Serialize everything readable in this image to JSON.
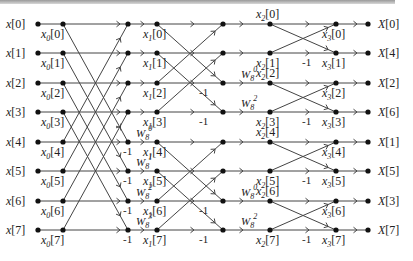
{
  "rows_y": [
    24,
    53,
    83,
    112,
    142,
    171,
    201,
    230
  ],
  "columns_x": {
    "input": 38,
    "s0": 63,
    "s1_in": 128,
    "s1": 157,
    "s2_in": 223,
    "s2": 270,
    "s3": 336,
    "output": 368
  },
  "inputs": [
    "x[0]",
    "x[1]",
    "x[2]",
    "x[3]",
    "x[4]",
    "x[5]",
    "x[6]",
    "x[7]"
  ],
  "outputs": [
    "X[0]",
    "X[4]",
    "X[2]",
    "X[6]",
    "X[1]",
    "X[5]",
    "X[3]",
    "X[7]"
  ],
  "stage0_labels": [
    {
      "base": "x",
      "sub": "0",
      "idx": "[0]"
    },
    {
      "base": "x",
      "sub": "0",
      "idx": "[1]"
    },
    {
      "base": "x",
      "sub": "0",
      "idx": "[2]"
    },
    {
      "base": "x",
      "sub": "0",
      "idx": "[3]"
    },
    {
      "base": "x",
      "sub": "0",
      "idx": "[4]"
    },
    {
      "base": "x",
      "sub": "0",
      "idx": "[5]"
    },
    {
      "base": "x",
      "sub": "0",
      "idx": "[6]"
    },
    {
      "base": "x",
      "sub": "0",
      "idx": "[7]"
    }
  ],
  "stage1_labels": [
    {
      "base": "x",
      "sub": "1",
      "idx": "[0]"
    },
    {
      "base": "x",
      "sub": "1",
      "idx": "[1]"
    },
    {
      "base": "x",
      "sub": "1",
      "idx": "[2]"
    },
    {
      "base": "x",
      "sub": "1",
      "idx": "[3]"
    },
    {
      "base": "x",
      "sub": "1",
      "idx": "[4]"
    },
    {
      "base": "x",
      "sub": "1",
      "idx": "[5]"
    },
    {
      "base": "x",
      "sub": "1",
      "idx": "[6]"
    },
    {
      "base": "x",
      "sub": "1",
      "idx": "[7]"
    }
  ],
  "stage2_labels": [
    {
      "base": "x",
      "sub": "2",
      "idx": "[0]"
    },
    {
      "base": "x",
      "sub": "2",
      "idx": "[1]"
    },
    {
      "base": "x",
      "sub": "2",
      "idx": "[2]"
    },
    {
      "base": "x",
      "sub": "2",
      "idx": "[3]"
    },
    {
      "base": "x",
      "sub": "2",
      "idx": "[4]"
    },
    {
      "base": "x",
      "sub": "2",
      "idx": "[5]"
    },
    {
      "base": "x",
      "sub": "2",
      "idx": "[6]"
    },
    {
      "base": "x",
      "sub": "2",
      "idx": "[7]"
    }
  ],
  "stage3_labels": [
    {
      "base": "x",
      "sub": "3",
      "idx": "[0]"
    },
    {
      "base": "x",
      "sub": "3",
      "idx": "[1]"
    },
    {
      "base": "x",
      "sub": "3",
      "idx": "[2]"
    },
    {
      "base": "x",
      "sub": "3",
      "idx": "[3]"
    },
    {
      "base": "x",
      "sub": "3",
      "idx": "[4]"
    },
    {
      "base": "x",
      "sub": "3",
      "idx": "[5]"
    },
    {
      "base": "x",
      "sub": "3",
      "idx": "[6]"
    },
    {
      "base": "x",
      "sub": "3",
      "idx": "[7]"
    }
  ],
  "stage1": {
    "pairs": [
      [
        0,
        4
      ],
      [
        1,
        5
      ],
      [
        2,
        6
      ],
      [
        3,
        7
      ]
    ],
    "negatives": [
      4,
      5,
      6,
      7
    ],
    "twiddles": [
      {
        "row": 4,
        "base": "W",
        "sub": "8",
        "sup": "0"
      },
      {
        "row": 5,
        "base": "W",
        "sub": "8",
        "sup": "1"
      },
      {
        "row": 6,
        "base": "W",
        "sub": "8",
        "sup": "2"
      },
      {
        "row": 7,
        "base": "W",
        "sub": "8",
        "sup": "3"
      }
    ]
  },
  "stage2": {
    "pairs": [
      [
        0,
        2
      ],
      [
        1,
        3
      ],
      [
        4,
        6
      ],
      [
        5,
        7
      ]
    ],
    "negatives": [
      2,
      3,
      6,
      7
    ],
    "twiddles": [
      {
        "row": 2,
        "base": "W",
        "sub": "8",
        "sup": "0"
      },
      {
        "row": 3,
        "base": "W",
        "sub": "8",
        "sup": "2"
      },
      {
        "row": 6,
        "base": "W",
        "sub": "8",
        "sup": "0"
      },
      {
        "row": 7,
        "base": "W",
        "sub": "8",
        "sup": "2"
      }
    ]
  },
  "stage3": {
    "pairs": [
      [
        0,
        1
      ],
      [
        2,
        3
      ],
      [
        4,
        5
      ],
      [
        6,
        7
      ]
    ],
    "negatives": [
      1,
      3,
      5,
      7
    ]
  },
  "negative_label": "-1"
}
